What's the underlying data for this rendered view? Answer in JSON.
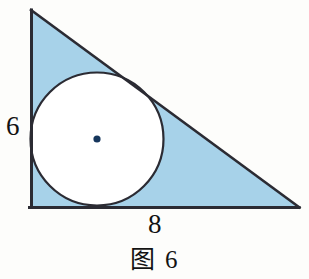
{
  "figure": {
    "caption": "图 6",
    "caption_number": "6",
    "kind": "right-triangle-with-inscribed-circle",
    "background_color": "#fdfdfb",
    "shaded_region_color": "#a7d2e9",
    "outline_color": "#2b2b33",
    "circle_fill_color": "#ffffff",
    "center_dot_color": "#16365c"
  },
  "labels": {
    "vertical_leg": "6",
    "horizontal_leg": "8"
  },
  "geometry": {
    "triangle": {
      "apex_top": {
        "x": 31,
        "y": 10
      },
      "corner_right_angle": {
        "x": 31,
        "y": 207
      },
      "vertex_right": {
        "x": 299,
        "y": 207
      },
      "vertical_leg_length": "6",
      "horizontal_leg_length": "8",
      "right_angle_at": "bottom-left"
    },
    "incircle": {
      "center": {
        "x": 97,
        "y": 139
      },
      "radius": 67,
      "tangent_points": [
        {
          "name": "tangent-vertical-leg",
          "x": 31,
          "y": 139
        },
        {
          "name": "tangent-horizontal-leg",
          "x": 97,
          "y": 206
        },
        {
          "name": "tangent-hypotenuse",
          "x": 140,
          "y": 90
        }
      ]
    }
  }
}
